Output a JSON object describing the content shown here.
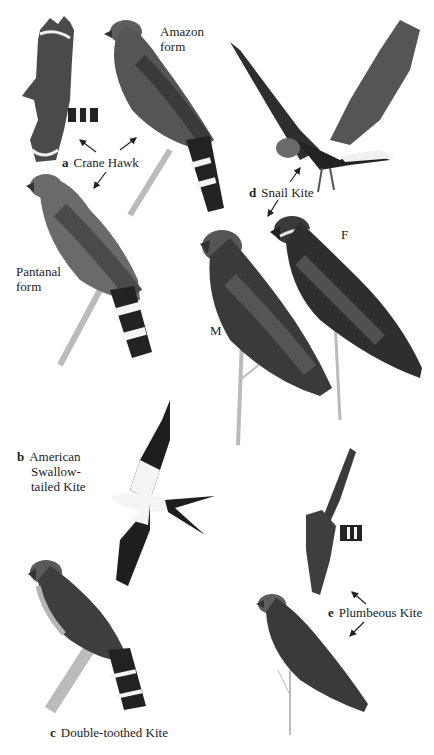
{
  "plate": {
    "title": "Field guide plate: kites and Crane Hawk",
    "species": [
      {
        "letter": "a",
        "name": "Crane Hawk",
        "forms": [
          "Amazon form",
          "Pantanal form"
        ]
      },
      {
        "letter": "b",
        "name": "American Swallow-tailed Kite",
        "lines": [
          "American",
          "Swallow-",
          "tailed Kite"
        ]
      },
      {
        "letter": "c",
        "name": "Double-toothed Kite"
      },
      {
        "letter": "d",
        "name": "Snail Kite",
        "sexes": [
          "M",
          "F"
        ]
      },
      {
        "letter": "e",
        "name": "Plumbeous Kite"
      }
    ],
    "labels": {
      "amazon_form_1": "Amazon",
      "amazon_form_2": "form",
      "pantanal_form_1": "Pantanal",
      "pantanal_form_2": "form",
      "crane_letter": "a",
      "crane_name": "Crane Hawk",
      "swallow_letter": "b",
      "swallow_line1": "American",
      "swallow_line2": "Swallow-",
      "swallow_line3": "tailed Kite",
      "double_letter": "c",
      "double_name": "Double-toothed Kite",
      "snail_letter": "d",
      "snail_name": "Snail Kite",
      "snail_male": "M",
      "snail_female": "F",
      "plumbeous_letter": "e",
      "plumbeous_name": "Plumbeous Kite"
    },
    "colors": {
      "background": "#ffffff",
      "dark_plumage": "#2a2a2a",
      "mid_plumage": "#5a5a5a",
      "light_plumage": "#8a8a8a",
      "white_band": "#f4f4f4",
      "branch": "#b8b8b8"
    }
  }
}
